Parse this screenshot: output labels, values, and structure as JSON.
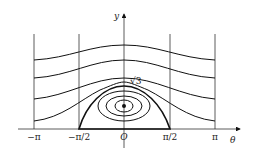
{
  "diagram": {
    "type": "phase-portrait",
    "axes": {
      "x_label": "θ",
      "y_label": "y",
      "origin_label": "O",
      "x_ticks": [
        "−π",
        "−π/2",
        "π/2",
        "π"
      ]
    },
    "annotations": {
      "sqrt3": "√3"
    },
    "colors": {
      "line": "#111111",
      "background": "#ffffff"
    }
  }
}
